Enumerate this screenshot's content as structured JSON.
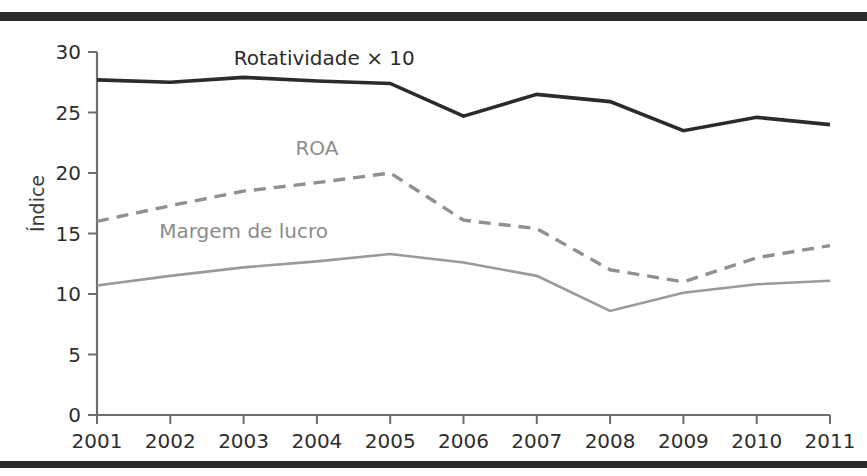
{
  "figure": {
    "background_color": "#ffffff",
    "border_color": "#2b2b2b",
    "has_top_rule": true,
    "has_bottom_rule": true
  },
  "chart_data": {
    "type": "line",
    "title": "",
    "subtitle": "",
    "xlabel": "",
    "ylabel": "Índice",
    "categories": [
      "2001",
      "2002",
      "2003",
      "2004",
      "2005",
      "2006",
      "2007",
      "2008",
      "2009",
      "2010",
      "2011"
    ],
    "x": [
      2001,
      2002,
      2003,
      2004,
      2005,
      2006,
      2007,
      2008,
      2009,
      2010,
      2011
    ],
    "ylim": [
      0,
      30
    ],
    "xlim": [
      2001,
      2011
    ],
    "yticks": [
      0,
      5,
      10,
      15,
      20,
      25,
      30
    ],
    "ytick_labels": [
      "0",
      "5",
      "10",
      "15",
      "20",
      "25",
      "30"
    ],
    "xtick_labels": [
      "2001",
      "2002",
      "2003",
      "2004",
      "2005",
      "2006",
      "2007",
      "2008",
      "2009",
      "2010",
      "2011"
    ],
    "grid": false,
    "legend_position": "inline-annotations",
    "series": [
      {
        "name": "Rotatividade × 10",
        "label": "Rotatividade × 10",
        "color": "#2b2b2b",
        "style": "solid",
        "stroke_width": 3.6,
        "values": [
          27.7,
          27.5,
          27.9,
          27.6,
          27.4,
          24.7,
          26.5,
          25.9,
          23.5,
          24.6,
          24.0
        ],
        "annotation": {
          "text": "Rotatividade × 10",
          "x": 2004.1,
          "y": 28.9
        }
      },
      {
        "name": "ROA",
        "label": "ROA",
        "color": "#909090",
        "style": "dashed",
        "stroke_width": 3.4,
        "dasharray": "12 8",
        "values": [
          16.0,
          17.3,
          18.5,
          19.2,
          20.0,
          16.1,
          15.4,
          12.0,
          11.0,
          13.0,
          14.0
        ],
        "annotation": {
          "text": "ROA",
          "x": 2004.0,
          "y": 21.5
        }
      },
      {
        "name": "Margem de lucro",
        "label": "Margem de lucro",
        "color": "#9a9a9a",
        "style": "solid",
        "stroke_width": 2.6,
        "values": [
          10.7,
          11.5,
          12.2,
          12.7,
          13.3,
          12.6,
          11.5,
          8.6,
          10.1,
          10.8,
          11.1
        ],
        "annotation": {
          "text": "Margem de lucro",
          "x": 2003.0,
          "y": 14.6
        }
      }
    ]
  }
}
